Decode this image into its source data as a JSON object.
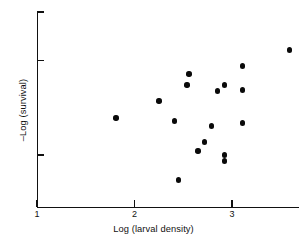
{
  "chart_data": {
    "type": "scatter",
    "title": "",
    "xlabel": "Log (larval density)",
    "ylabel": "–Log (survival)",
    "xlim": [
      1,
      3.69
    ],
    "ylim": [
      0,
      1
    ],
    "xticks": [
      1,
      2,
      3
    ],
    "xticklabels": [
      "1",
      "2",
      "3"
    ],
    "yticks": [
      1.0,
      0.753,
      0.267
    ],
    "yticklabels": [
      "",
      "",
      ""
    ],
    "grid": false,
    "legend": null,
    "points": [
      {
        "x": 1.81,
        "y": 0.456
      },
      {
        "x": 2.25,
        "y": 0.544
      },
      {
        "x": 2.41,
        "y": 0.441
      },
      {
        "x": 2.45,
        "y": 0.138
      },
      {
        "x": 2.56,
        "y": 0.682
      },
      {
        "x": 2.54,
        "y": 0.626
      },
      {
        "x": 2.65,
        "y": 0.287
      },
      {
        "x": 2.72,
        "y": 0.333
      },
      {
        "x": 2.79,
        "y": 0.415
      },
      {
        "x": 2.85,
        "y": 0.595
      },
      {
        "x": 2.92,
        "y": 0.626
      },
      {
        "x": 2.92,
        "y": 0.267
      },
      {
        "x": 2.92,
        "y": 0.236
      },
      {
        "x": 3.11,
        "y": 0.723
      },
      {
        "x": 3.11,
        "y": 0.6
      },
      {
        "x": 3.11,
        "y": 0.431
      },
      {
        "x": 3.59,
        "y": 0.805
      }
    ]
  },
  "axes": {
    "x_title": "Log (larval density)",
    "y_title": "–Log (survival)",
    "x_tick_labels": [
      "1",
      "2",
      "3"
    ]
  }
}
